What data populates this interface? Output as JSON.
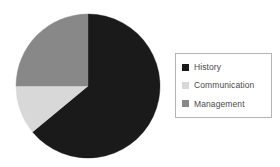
{
  "chart_data": {
    "type": "pie",
    "title": "",
    "labels": [
      "History",
      "Communication",
      "Management"
    ],
    "values": [
      64,
      11,
      25
    ],
    "colors": [
      "#1a1a1a",
      "#d8d8d8",
      "#888888"
    ],
    "legend_position": "right",
    "grid": false,
    "slices": [
      {
        "label": "History",
        "value": 64,
        "color": "#1a1a1a",
        "start_angle": 0,
        "end_angle": 230.4
      },
      {
        "label": "Communication",
        "value": 11,
        "color": "#d8d8d8",
        "start_angle": 230.4,
        "end_angle": 270.0
      },
      {
        "label": "Management",
        "value": 25,
        "color": "#888888",
        "start_angle": 270.0,
        "end_angle": 360.0
      }
    ]
  },
  "legend": {
    "items": [
      {
        "label": "History",
        "color": "#1a1a1a",
        "swatch_name": "legend-swatch-history"
      },
      {
        "label": "Communication",
        "color": "#d8d8d8",
        "swatch_name": "legend-swatch-communication"
      },
      {
        "label": "Management",
        "color": "#888888",
        "swatch_name": "legend-swatch-management"
      }
    ]
  },
  "geometry": {
    "center_x": 88,
    "center_y": 86,
    "radius": 72
  }
}
